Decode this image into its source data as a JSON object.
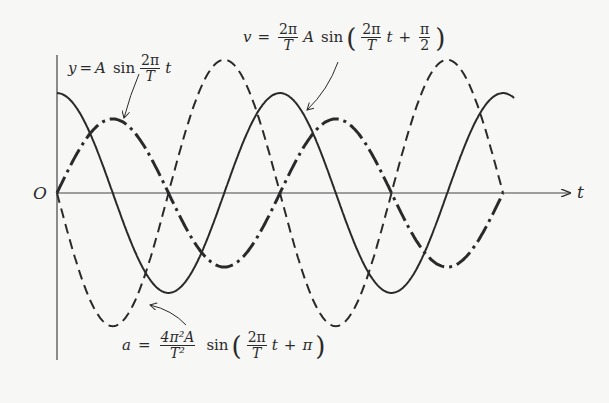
{
  "diagram": {
    "origin_label": "O",
    "t_axis_label": "t",
    "colors": {
      "ink": "#2a2a2a",
      "background": "#f7f7f6"
    },
    "labels": {
      "displacement": {
        "lhs": "y",
        "eq": "=",
        "amp": "A",
        "fn": "sin",
        "frac_num": "2π",
        "frac_den": "T",
        "var": "t"
      },
      "velocity": {
        "lhs": "v",
        "eq": "=",
        "coef_num": "2π",
        "coef_den": "T",
        "amp": "A",
        "fn": "sin",
        "open": "(",
        "frac_num": "2π",
        "frac_den": "T",
        "var": "t",
        "plus": "+",
        "phase_num": "π",
        "phase_den": "2",
        "close": ")"
      },
      "acceleration": {
        "lhs": "a",
        "eq": "=",
        "coef_num": "4π²A",
        "coef_den": "T²",
        "fn": "sin",
        "open": "(",
        "frac_num": "2π",
        "frac_den": "T",
        "var": "t",
        "plus": "+",
        "phase": "π",
        "close": ")"
      }
    }
  },
  "chart_data": {
    "type": "line",
    "title": "",
    "xlabel": "t",
    "ylabel": "",
    "origin": "O",
    "period_T_px": 223,
    "x_range_periods": [
      0,
      2.0
    ],
    "grid": false,
    "series": [
      {
        "name": "y = A sin(2π/T t)",
        "style": "dash-dot (thick)",
        "amplitude": 1.0,
        "phase": 0
      },
      {
        "name": "v = (2π/T) A sin(2π/T t + π/2)",
        "style": "solid",
        "amplitude": 1.35,
        "phase": 1.5708,
        "extends_to_periods": 2.05
      },
      {
        "name": "a = (4π²A/T²) sin(2π/T t + π)",
        "style": "dashed",
        "amplitude": 1.8,
        "phase": 3.1416
      }
    ]
  }
}
